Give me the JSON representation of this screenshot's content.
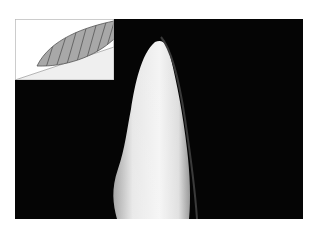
{
  "figure": {
    "colors": {
      "background": "#050505",
      "tooth": "#e8e8e8",
      "inset_upper": "#ffffff",
      "inset_lower": "#efefef",
      "lens_fill": "#a8a8a8",
      "hatch": "#555555"
    }
  }
}
